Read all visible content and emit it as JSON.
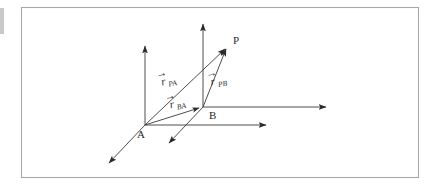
{
  "figure": {
    "frame": {
      "border_color": "#a8a8a8",
      "background_color": "#ffffff",
      "left_tick_color": "#b5b5b5"
    },
    "line_color": "#3a3a3a",
    "points": [
      {
        "id": "A",
        "label": "A",
        "x": 145,
        "y": 125
      },
      {
        "id": "B",
        "label": "B",
        "x": 203,
        "y": 107
      },
      {
        "id": "P",
        "label": "P",
        "x": 229,
        "y": 45
      }
    ],
    "vectors": [
      {
        "id": "r_PA",
        "symbol": "r",
        "subscript": "PA",
        "accent": "arrow",
        "from": "A",
        "to": "P",
        "label_x": 160,
        "label_y": 80
      },
      {
        "id": "r_PB",
        "symbol": "r",
        "subscript": "PB",
        "accent": "arrow",
        "from": "B",
        "to": "P",
        "label_x": 213,
        "label_y": 80
      },
      {
        "id": "r_BA",
        "symbol": "r",
        "subscript": "BA",
        "accent": "arrow",
        "from": "A",
        "to": "B",
        "label_x": 170,
        "label_y": 104
      }
    ],
    "axes": [
      {
        "id": "axis-a-vertical",
        "origin": "A",
        "direction": "up",
        "tip_x": 145,
        "tip_y": 42
      },
      {
        "id": "axis-a-horizontal",
        "origin": "A",
        "direction": "right",
        "tip_x": 270,
        "tip_y": 125
      },
      {
        "id": "axis-a-oblique",
        "origin": "A",
        "direction": "down-left",
        "tip_x": 106,
        "tip_y": 166
      },
      {
        "id": "axis-b-vertical",
        "origin": "B",
        "direction": "up",
        "tip_x": 203,
        "tip_y": 20
      },
      {
        "id": "axis-b-horizontal",
        "origin": "B",
        "direction": "right",
        "tip_x": 330,
        "tip_y": 107
      },
      {
        "id": "axis-b-oblique",
        "origin": "B",
        "direction": "down-left",
        "tip_x": 166,
        "tip_y": 146
      }
    ]
  }
}
